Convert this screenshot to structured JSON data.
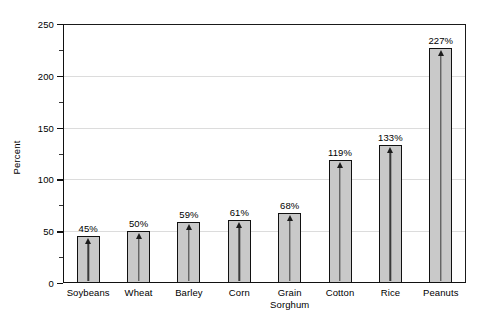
{
  "chart_data": {
    "type": "bar",
    "title": "",
    "xlabel": "",
    "ylabel": "Percent",
    "ylim": [
      0,
      250
    ],
    "ytick_step": 50,
    "yminor_step": 25,
    "grid": true,
    "legend": "none",
    "categories": [
      "Soybeans",
      "Wheat",
      "Barley",
      "Corn",
      "Grain\nSorghum",
      "Cotton",
      "Rice",
      "Peanuts"
    ],
    "values": [
      45,
      50,
      59,
      61,
      68,
      119,
      133,
      227
    ],
    "data_labels": [
      "45%",
      "50%",
      "59%",
      "61%",
      "68%",
      "119%",
      "133%",
      "227%"
    ],
    "ytick_labels": [
      "0",
      "50",
      "100",
      "150",
      "200",
      "250"
    ],
    "bar_marker": "up-arrow-inside-bar"
  },
  "style": {
    "bar_fill": "#c9c9c9",
    "bar_border": "#111111",
    "gridline_color": "#dcdcdc",
    "axis_color": "#111111",
    "background": "#ffffff",
    "text_color": "#000000"
  }
}
